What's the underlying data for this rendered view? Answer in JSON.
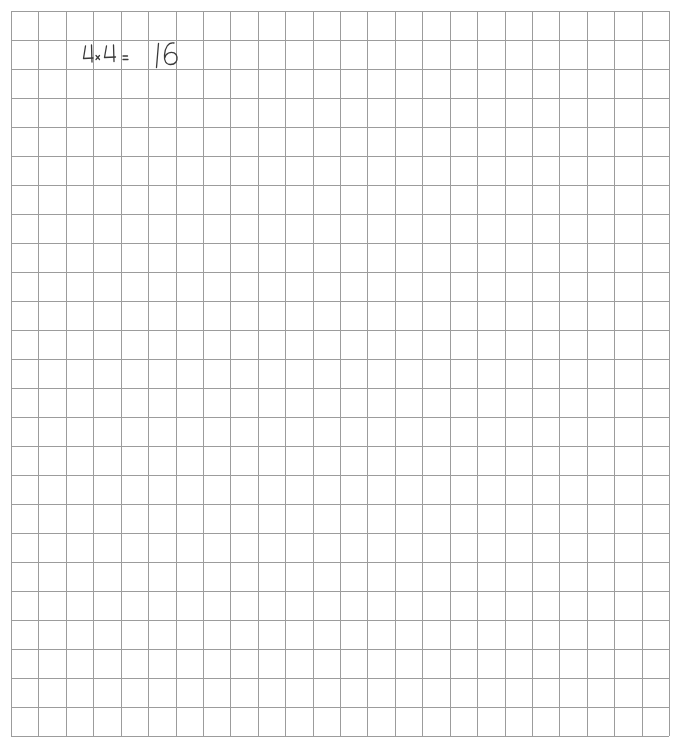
{
  "sheet": {
    "type": "graph-paper",
    "background_color": "#ffffff",
    "grid": {
      "left": 11,
      "top": 11,
      "right": 669,
      "bottom": 736,
      "columns": 24,
      "rows": 25,
      "line_color": "#9c9c9c"
    }
  },
  "handwriting": {
    "text": "4×4= 16",
    "ink_color": "#3a3a3a",
    "expression": {
      "operand_1": "4",
      "operator": "×",
      "operand_2": "4",
      "equals": "=",
      "result": "16"
    }
  }
}
